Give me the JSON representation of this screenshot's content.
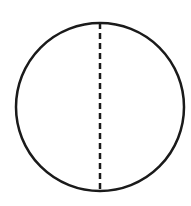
{
  "diagram": {
    "stroke_color": "#1a1a1a",
    "background": "#ffffff",
    "circle": {
      "cx": 100,
      "cy": 107,
      "r": 84,
      "stroke_width": 2.5
    },
    "diameter": {
      "x": 100,
      "y1": 23,
      "y2": 191,
      "stroke_width": 2.5,
      "dash": "6 4"
    }
  }
}
